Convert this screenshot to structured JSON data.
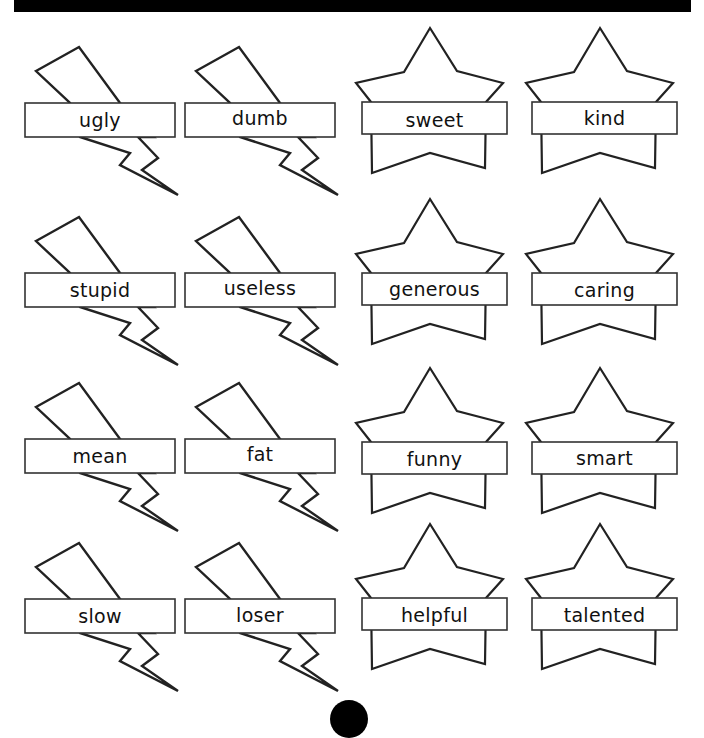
{
  "worksheet": {
    "negative_words": {
      "shape": "lightning-bolt",
      "items": [
        "ugly",
        "dumb",
        "stupid",
        "useless",
        "mean",
        "fat",
        "slow",
        "loser"
      ]
    },
    "positive_words": {
      "shape": "star",
      "items": [
        "sweet",
        "kind",
        "generous",
        "caring",
        "funny",
        "smart",
        "helpful",
        "talented"
      ]
    },
    "colors": {
      "ink": "#111111",
      "paper": "#ffffff",
      "bar": "#000000"
    }
  }
}
